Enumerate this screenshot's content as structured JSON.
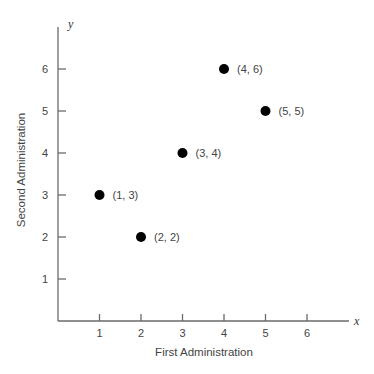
{
  "chart_data": {
    "type": "scatter",
    "title": "",
    "xlabel": "First Administration",
    "ylabel": "Second Administration",
    "x_axis_variable": "x",
    "y_axis_variable": "y",
    "xlim": [
      0,
      7
    ],
    "ylim": [
      0,
      7
    ],
    "x_ticks": [
      "1",
      "2",
      "3",
      "4",
      "5",
      "6"
    ],
    "y_ticks": [
      "1",
      "2",
      "3",
      "4",
      "5",
      "6"
    ],
    "grid": false,
    "legend": null,
    "points": [
      {
        "x": 1,
        "y": 3,
        "label": "(1, 3)"
      },
      {
        "x": 2,
        "y": 2,
        "label": "(2, 2)"
      },
      {
        "x": 3,
        "y": 4,
        "label": "(3, 4)"
      },
      {
        "x": 4,
        "y": 6,
        "label": "(4, 6)"
      },
      {
        "x": 5,
        "y": 5,
        "label": "(5, 5)"
      }
    ],
    "point_color": "#000000"
  }
}
